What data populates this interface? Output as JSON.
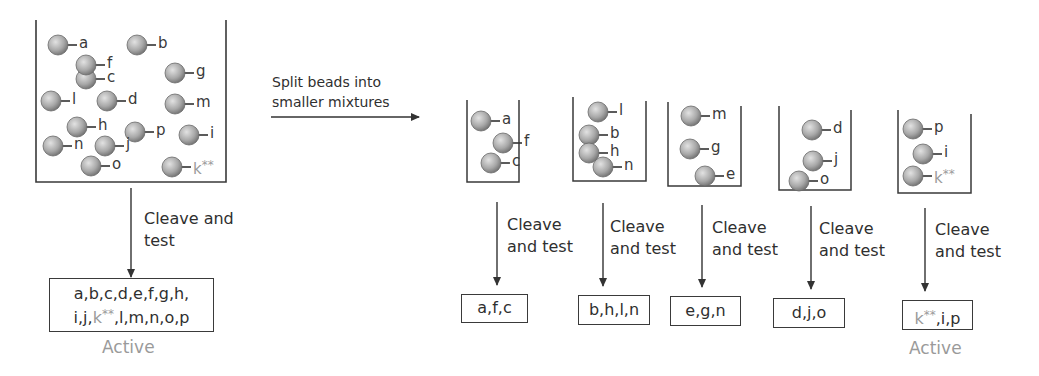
{
  "colors": {
    "line": "#3a3a3a",
    "bead_light": "#d6d6d6",
    "bead_dark": "#7a7a7a",
    "active_gray": "#9a9a9a"
  },
  "main_beaker": {
    "beads": [
      {
        "label": "a",
        "x": 58,
        "y": 45
      },
      {
        "label": "b",
        "x": 137,
        "y": 45
      },
      {
        "label": "c",
        "x": 86,
        "y": 79
      },
      {
        "label": "f",
        "x": 86,
        "y": 65
      },
      {
        "label": "g",
        "x": 175,
        "y": 73
      },
      {
        "label": "l",
        "x": 51,
        "y": 101
      },
      {
        "label": "d",
        "x": 107,
        "y": 101
      },
      {
        "label": "m",
        "x": 175,
        "y": 104
      },
      {
        "label": "h",
        "x": 77,
        "y": 127
      },
      {
        "label": "p",
        "x": 135,
        "y": 132
      },
      {
        "label": "i",
        "x": 189,
        "y": 135
      },
      {
        "label": "n",
        "x": 53,
        "y": 146
      },
      {
        "label": "j",
        "x": 105,
        "y": 146
      },
      {
        "label": "o",
        "x": 91,
        "y": 166
      },
      {
        "label": "k**",
        "x": 172,
        "y": 167,
        "highlight": true
      }
    ]
  },
  "main_step": {
    "arrow_label_line1": "Cleave and",
    "arrow_label_line2": "test",
    "result_line1": "a,b,c,d,e,f,g,h,",
    "result_line2_pre": "i,j,",
    "result_line2_k": "k",
    "result_line2_star": "**",
    "result_line2_post": ",l,m,n,o,p",
    "status": "Active"
  },
  "split_arrow": {
    "label_line1": "Split beads into",
    "label_line2": "smaller mixtures"
  },
  "sub_mixtures": [
    {
      "beads": [
        {
          "label": "a"
        },
        {
          "label": "f"
        },
        {
          "label": "c"
        }
      ],
      "arrow_label_line1": "Cleave",
      "arrow_label_line2": "and test",
      "result": "a,f,c",
      "status": ""
    },
    {
      "beads": [
        {
          "label": "l"
        },
        {
          "label": "b"
        },
        {
          "label": "h"
        },
        {
          "label": "n"
        }
      ],
      "arrow_label_line1": "Cleave",
      "arrow_label_line2": "and test",
      "result": "b,h,l,n",
      "status": ""
    },
    {
      "beads": [
        {
          "label": "m"
        },
        {
          "label": "g"
        },
        {
          "label": "e"
        }
      ],
      "arrow_label_line1": "Cleave",
      "arrow_label_line2": "and test",
      "result": "e,g,n",
      "status": ""
    },
    {
      "beads": [
        {
          "label": "d"
        },
        {
          "label": "j"
        },
        {
          "label": "o"
        }
      ],
      "arrow_label_line1": "Cleave",
      "arrow_label_line2": "and test",
      "result": "d,j,o",
      "status": ""
    },
    {
      "beads": [
        {
          "label": "p"
        },
        {
          "label": "i"
        },
        {
          "label": "k**",
          "highlight": true
        }
      ],
      "arrow_label_line1": "Cleave",
      "arrow_label_line2": "and test",
      "result_k": "k",
      "result_star": "**",
      "result_post": ",i,p",
      "status": "Active"
    }
  ]
}
